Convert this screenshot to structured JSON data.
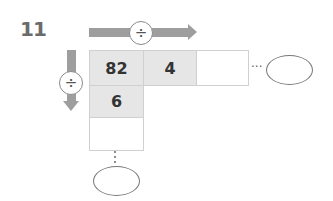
{
  "problem": {
    "number": "11",
    "horizontal_operator": "÷",
    "vertical_operator": "÷",
    "row1": [
      "82",
      "4",
      ""
    ],
    "column1": [
      "82",
      "6",
      ""
    ],
    "horizontal_continuation": "···",
    "vertical_continuation": "⋮",
    "answer_ovals": [
      "",
      ""
    ]
  },
  "colors": {
    "arrow": "#9e9e9e",
    "filled_cell": "#e6e6e6",
    "cell_border": "#d0d0d0",
    "question_number": "#6b6b6b"
  }
}
